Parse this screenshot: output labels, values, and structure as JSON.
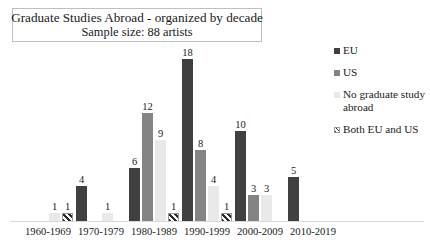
{
  "chart_data": {
    "type": "bar",
    "title": "Graduate Studies Abroad - organized by decade",
    "subtitle": "Sample size: 88 artists",
    "xlabel": "",
    "ylabel": "",
    "ylim": [
      0,
      18
    ],
    "grid": false,
    "legend_position": "right",
    "grouping": "clustered",
    "categories": [
      "1960-1969",
      "1970-1979",
      "1980-1989",
      "1990-1999",
      "2000-2009",
      "2010-2019"
    ],
    "series": [
      {
        "name": "EU",
        "color": "#404040",
        "values": [
          null,
          4,
          6,
          18,
          10,
          5
        ],
        "labels": [
          "",
          "4",
          "6",
          "18",
          "10",
          "5"
        ]
      },
      {
        "name": "US",
        "color": "#848484",
        "values": [
          null,
          null,
          12,
          8,
          3,
          null
        ],
        "labels": [
          "",
          "",
          "12",
          "8",
          "3",
          ""
        ]
      },
      {
        "name": "No graduate study abroad",
        "color": "#e9e9e9",
        "values": [
          1,
          1,
          9,
          4,
          3,
          null
        ],
        "labels": [
          "1",
          "1",
          "9",
          "4",
          "3",
          ""
        ]
      },
      {
        "name": "Both EU and US",
        "color": "#ffffff",
        "pattern": "diagonal-hatch",
        "values": [
          1,
          null,
          1,
          1,
          null,
          null
        ],
        "labels": [
          "1",
          "",
          "1",
          "1",
          "",
          ""
        ]
      }
    ]
  },
  "legend": {
    "items": [
      {
        "label": "EU",
        "icon": "legend-swatch-eu"
      },
      {
        "label": "US",
        "icon": "legend-swatch-us"
      },
      {
        "label": "No graduate study abroad",
        "icon": "legend-swatch-no-graduate-study-abroad"
      },
      {
        "label": "Both EU and US",
        "icon": "legend-swatch-both-eu-and-us"
      }
    ]
  }
}
